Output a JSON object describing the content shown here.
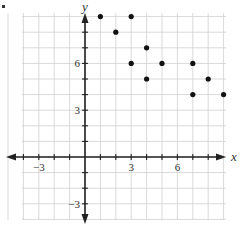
{
  "chart_data": {
    "type": "scatter",
    "title": "",
    "xlabel": "x",
    "ylabel": "y",
    "xlim": [
      -5.5,
      9.8
    ],
    "ylim": [
      -4.2,
      9.4
    ],
    "grid": true,
    "legend": null,
    "x_ticks_labeled": [
      -3,
      3,
      6
    ],
    "y_ticks_labeled": [
      -3,
      3,
      6
    ],
    "x_tick_labels": [
      "−3",
      "3",
      "6"
    ],
    "y_tick_labels": [
      "−3",
      "3",
      "6"
    ],
    "series": [
      {
        "name": "points",
        "color": "#111111",
        "points": [
          {
            "x": 1,
            "y": 9
          },
          {
            "x": 2,
            "y": 8
          },
          {
            "x": 3,
            "y": 9
          },
          {
            "x": 3,
            "y": 6
          },
          {
            "x": 4,
            "y": 7
          },
          {
            "x": 4,
            "y": 5
          },
          {
            "x": 5,
            "y": 6
          },
          {
            "x": 7,
            "y": 6
          },
          {
            "x": 7,
            "y": 4
          },
          {
            "x": 8,
            "y": 5
          },
          {
            "x": 9,
            "y": 4
          }
        ]
      }
    ]
  },
  "style": {
    "grid_color": "#cfcfcf",
    "axis_color": "#222222",
    "point_color": "#111111",
    "text_color": "#333333"
  }
}
